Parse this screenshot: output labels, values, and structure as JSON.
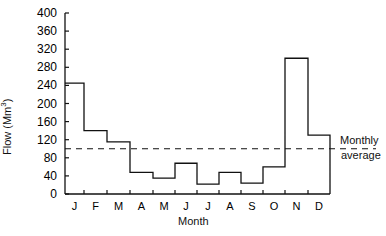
{
  "chart_data": {
    "type": "line",
    "subtype": "step",
    "title": "",
    "xlabel": "Month",
    "ylabel": "Flow (Mm³)",
    "categories": [
      "J",
      "F",
      "M",
      "A",
      "M",
      "J",
      "J",
      "A",
      "S",
      "O",
      "N",
      "D"
    ],
    "values": [
      245,
      140,
      115,
      48,
      35,
      68,
      22,
      48,
      24,
      60,
      300,
      130
    ],
    "ylim": [
      0,
      400
    ],
    "yticks": [
      0,
      40,
      80,
      120,
      160,
      200,
      240,
      280,
      320,
      360,
      400
    ],
    "reference_line": {
      "value": 100,
      "label": "Monthly average",
      "style": "dashed"
    },
    "grid": false,
    "legend": "annotation right of dashed line"
  },
  "axis": {
    "ylabel": "Flow (Mm",
    "ylabel_sup": "3",
    "ylabel_end": ")",
    "xlabel": "Month"
  },
  "annotation": {
    "line1": "Monthly",
    "line2": "average"
  }
}
